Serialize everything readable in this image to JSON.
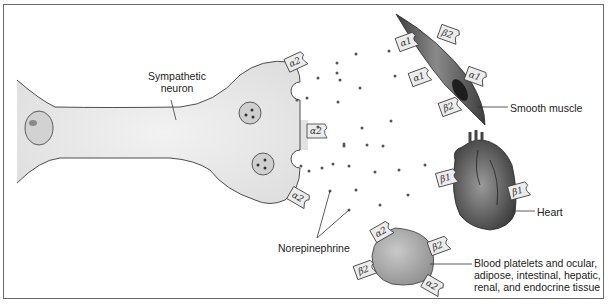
{
  "figure": {
    "labels": {
      "neuron": "Sympathetic neuron",
      "neuron_line1": "Sympathetic",
      "neuron_line2": "neuron",
      "norepinephrine": "Norepinephrine",
      "smooth_muscle": "Smooth muscle",
      "heart": "Heart",
      "other_line1": "Blood platelets and ocular,",
      "other_line2": "adipose, intestinal, hepatic,",
      "other_line3": "renal, and endocrine tissue"
    },
    "receptors": {
      "neuron": [
        "α2",
        "α2",
        "α2"
      ],
      "smooth_muscle": [
        "α1",
        "β2",
        "α1",
        "α1",
        "β2"
      ],
      "heart": [
        "β1",
        "β1"
      ],
      "other_tissue": [
        "α2",
        "β2",
        "β2",
        "α2"
      ]
    },
    "colors": {
      "neuron_fill": "#e6e6e6",
      "outline": "#3a3a3a",
      "receptor_fill": "#ececec",
      "muscle": "#5a5a5a",
      "heart": "#6a6a6a",
      "cell": "#a8a8a8",
      "dot": "#555555",
      "border": "#6a6a6a"
    }
  }
}
